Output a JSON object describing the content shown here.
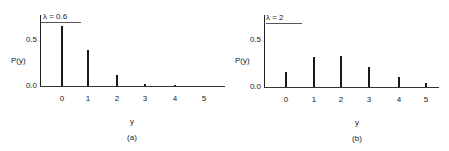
{
  "chart_data": [
    {
      "type": "bar",
      "title": "λ = 0.6",
      "panel_label": "(a)",
      "xlabel": "y",
      "ylabel": "P(y)",
      "categories": [
        "0",
        "1",
        "2",
        "3",
        "4",
        "5"
      ],
      "values": [
        0.549,
        0.329,
        0.099,
        0.02,
        0.003,
        0.0005
      ],
      "yticks": [
        "0.0",
        "0.5"
      ],
      "ylim": [
        0,
        0.65
      ],
      "grid": false,
      "legend": "none"
    },
    {
      "type": "bar",
      "title": "λ = 2",
      "panel_label": "(b)",
      "xlabel": "y",
      "ylabel": "P(y)",
      "categories": [
        "0",
        "1",
        "2",
        "3",
        "4",
        "5"
      ],
      "values": [
        0.135,
        0.271,
        0.28,
        0.18,
        0.09,
        0.036
      ],
      "yticks": [
        "0.0",
        "0.5"
      ],
      "ylim": [
        0,
        0.65
      ],
      "grid": false,
      "legend": "none"
    }
  ],
  "panels": {
    "a": {
      "lambda_label": "λ = 0.6",
      "ylabel": "P(y)",
      "ytick_top": "0.5",
      "ytick_bottom": "0.0",
      "xticks": [
        "0",
        "1",
        "2",
        "3",
        "4",
        "5"
      ],
      "xlabel": "y",
      "caption": "(a)"
    },
    "b": {
      "lambda_label": "λ = 2",
      "ylabel": "P(y)",
      "ytick_top": "0.5",
      "ytick_bottom": "0.0",
      "xticks": [
        "0",
        "1",
        "2",
        "3",
        "4",
        "5"
      ],
      "xlabel": "y",
      "caption": "(b)"
    }
  }
}
